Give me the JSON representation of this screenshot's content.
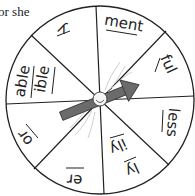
{
  "caption": "or she",
  "wheel": {
    "segments": [
      {
        "id": "y",
        "label": "y"
      },
      {
        "id": "ment",
        "label": "ment"
      },
      {
        "id": "ful",
        "label": "ful"
      },
      {
        "id": "less",
        "label": "less"
      },
      {
        "id": "ly-ily",
        "label": "ly",
        "label2": "ily"
      },
      {
        "id": "er",
        "label": "er"
      },
      {
        "id": "or",
        "label": "or"
      },
      {
        "id": "able-ible",
        "label": "able",
        "label2": "ible"
      }
    ],
    "spinner_color": "#6b6b6b",
    "line_color": "#222222"
  }
}
